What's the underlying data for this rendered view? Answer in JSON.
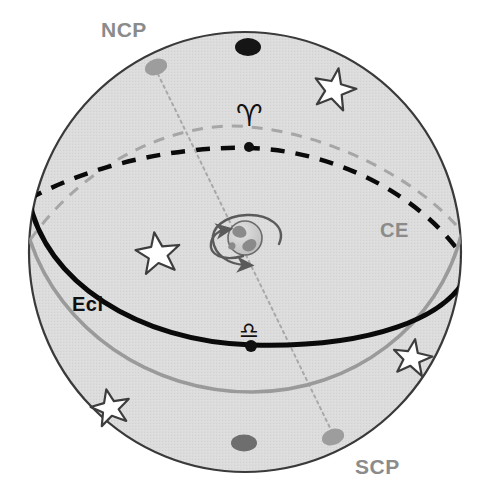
{
  "figure": {
    "background_color": "#ffffff",
    "sphere_fill": "#dcdcdc",
    "sphere_outline_color": "#3a3a3a"
  },
  "labels": {
    "ncp": "NCP",
    "scp": "SCP",
    "celestial_equator": "CE",
    "ecliptic": "Ecl"
  },
  "label_colors": {
    "ncp": "#8b8b8b",
    "scp": "#8b8b8b",
    "celestial_equator": "#8b8b8b",
    "ecliptic": "#101010"
  },
  "symbols": {
    "vernal_equinox": "♈",
    "vernal_equinox_name": "aries-symbol",
    "autumnal_equinox": "♎",
    "autumnal_equinox_name": "libra-symbol"
  },
  "curves": {
    "ecliptic": {
      "name": "ecliptic",
      "color": "#0a0a0a",
      "front_style": "solid",
      "back_style": "dashed",
      "width_front": 5,
      "width_back": 4.5
    },
    "celestial_equator": {
      "name": "celestial-equator",
      "color": "#9a9a9a",
      "front_style": "solid",
      "back_style": "dashed",
      "width_front": 3.5,
      "width_back": 3
    },
    "polar_axis": {
      "name": "polar-axis",
      "color": "#a8a8a8",
      "style": "dotted",
      "width": 2
    }
  },
  "poles": {
    "north_celestial_pole": {
      "color": "#9d9d9d",
      "label": "NCP"
    },
    "south_celestial_pole": {
      "color": "#9d9d9d",
      "label": "SCP"
    },
    "north_ecliptic_pole": {
      "color": "#151515",
      "label": ""
    },
    "south_ecliptic_pole": {
      "color": "#6e6e6e",
      "label": ""
    }
  },
  "earth": {
    "name": "earth-globe",
    "fill": "#d2d2d2",
    "outline": "#6a6a6a",
    "rotation_arrow_color": "#5a5a5a"
  },
  "stars": {
    "count": 5,
    "fill": "#ffffff",
    "outline": "#3d3d3d"
  },
  "equinox_points": {
    "vernal": {
      "color": "#101010"
    },
    "autumnal": {
      "color": "#101010"
    }
  }
}
